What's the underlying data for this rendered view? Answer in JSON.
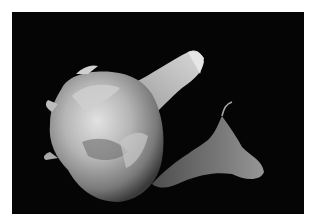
{
  "image": {
    "subject": "Garlic bulb with dried papery skin on black background",
    "alt": "Photograph of a garlic bulb with papery skin and a trailing dried stem against a black background",
    "colors": {
      "background": "#050505",
      "border": "#ffffff",
      "skin_light": "#d8d8d8",
      "skin_mid": "#9a9a9a",
      "skin_dark": "#4a4a4a"
    }
  }
}
